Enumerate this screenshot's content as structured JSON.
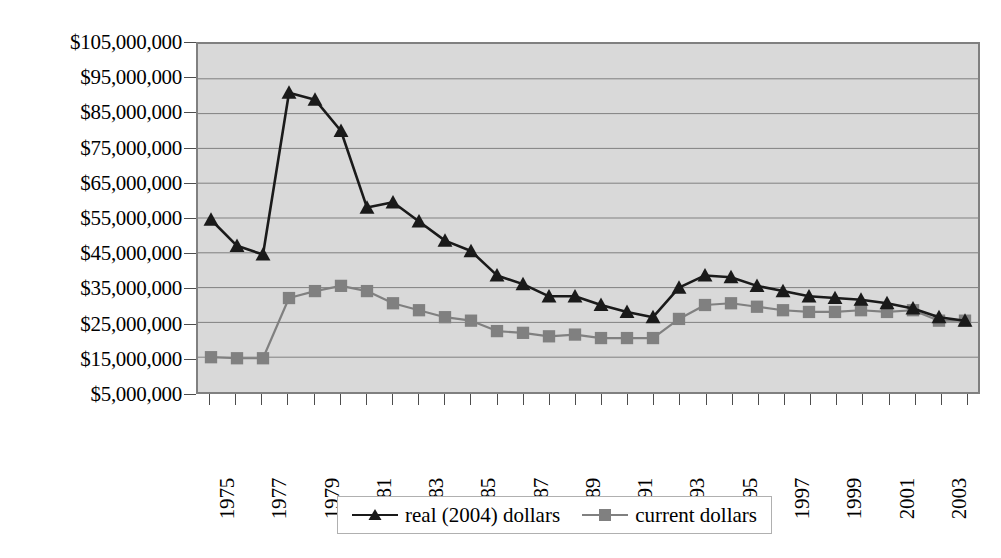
{
  "chart_data": {
    "type": "line",
    "title": "",
    "xlabel": "",
    "ylabel": "",
    "grid": true,
    "legend_position": "bottom",
    "plot_background": "#d9d9d9",
    "x": [
      1975,
      1976,
      1977,
      1978,
      1979,
      1980,
      1981,
      1982,
      1983,
      1984,
      1985,
      1986,
      1987,
      1988,
      1989,
      1990,
      1991,
      1992,
      1993,
      1994,
      1995,
      1996,
      1997,
      1998,
      1999,
      2000,
      2001,
      2002,
      2003,
      2004
    ],
    "categories": [
      "1975",
      "1976",
      "1977",
      "1978",
      "1979",
      "1980",
      "1981",
      "1982",
      "1983",
      "1984",
      "1985",
      "1986",
      "1987",
      "1988",
      "1989",
      "1990",
      "1991",
      "1992",
      "1993",
      "1994",
      "1995",
      "1996",
      "1997",
      "1998",
      "1999",
      "2000",
      "2001",
      "2002",
      "2003",
      "2004"
    ],
    "xtick_labels": [
      "1975",
      "1977",
      "1979",
      "1981",
      "1983",
      "1985",
      "1987",
      "1989",
      "1991",
      "1993",
      "1995",
      "1997",
      "1999",
      "2001",
      "2003"
    ],
    "ytick_labels": [
      "$105,000,000",
      "$95,000,000",
      "$85,000,000",
      "$75,000,000",
      "$65,000,000",
      "$55,000,000",
      "$45,000,000",
      "$35,000,000",
      "$25,000,000",
      "$15,000,000",
      "$5,000,000"
    ],
    "ytick_values": [
      105000000,
      95000000,
      85000000,
      75000000,
      65000000,
      55000000,
      45000000,
      35000000,
      25000000,
      15000000,
      5000000
    ],
    "ylim": [
      5000000,
      105000000
    ],
    "series": [
      {
        "name": "real (2004) dollars",
        "color": "#1a1a1a",
        "marker": "triangle",
        "values": [
          54500000,
          47000000,
          44500000,
          91000000,
          89000000,
          80000000,
          58000000,
          59500000,
          54000000,
          48500000,
          45500000,
          38500000,
          36000000,
          32500000,
          32500000,
          30000000,
          28000000,
          26500000,
          35000000,
          38500000,
          38000000,
          35500000,
          34000000,
          32500000,
          32000000,
          31500000,
          30500000,
          29000000,
          26500000,
          25500000
        ]
      },
      {
        "name": "current dollars",
        "color": "#808080",
        "marker": "square",
        "values": [
          15000000,
          14700000,
          14700000,
          32000000,
          34000000,
          35500000,
          34000000,
          30500000,
          28500000,
          26500000,
          25500000,
          22500000,
          22000000,
          21000000,
          21500000,
          20500000,
          20500000,
          20500000,
          26000000,
          30000000,
          30500000,
          29500000,
          28500000,
          28000000,
          28000000,
          28500000,
          28000000,
          28500000,
          25500000,
          25500000
        ]
      }
    ]
  },
  "legend": {
    "entries": [
      {
        "label": "real (2004) dollars",
        "marker": "triangle-marker-icon",
        "color": "#1a1a1a"
      },
      {
        "label": "current dollars",
        "marker": "square-marker-icon",
        "color": "#808080"
      }
    ]
  }
}
